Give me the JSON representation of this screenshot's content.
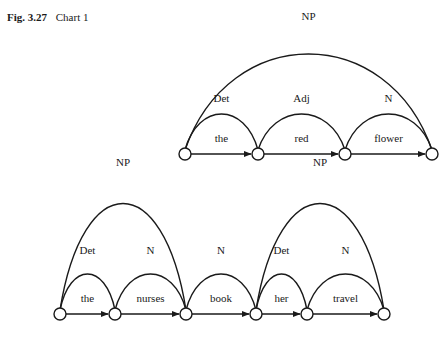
{
  "caption": {
    "figure": "Fig. 3.27",
    "title": "Chart 1"
  },
  "charts": [
    {
      "name": "chart-1",
      "nodes": 4,
      "words": [
        "the",
        "red",
        "flower"
      ],
      "constituents": [
        {
          "label": "Det",
          "from": 0,
          "to": 1
        },
        {
          "label": "Adj",
          "from": 1,
          "to": 2
        },
        {
          "label": "N",
          "from": 2,
          "to": 3
        },
        {
          "label": "NP",
          "from": 0,
          "to": 3
        }
      ]
    },
    {
      "name": "chart-2",
      "nodes": 6,
      "words": [
        "the",
        "nurses",
        "book",
        "her",
        "travel"
      ],
      "constituents": [
        {
          "label": "Det",
          "from": 0,
          "to": 1
        },
        {
          "label": "N",
          "from": 1,
          "to": 2
        },
        {
          "label": "N",
          "from": 2,
          "to": 3
        },
        {
          "label": "Det",
          "from": 3,
          "to": 4
        },
        {
          "label": "N",
          "from": 4,
          "to": 5
        },
        {
          "label": "NP",
          "from": 0,
          "to": 2
        },
        {
          "label": "NP",
          "from": 3,
          "to": 5
        }
      ]
    }
  ]
}
